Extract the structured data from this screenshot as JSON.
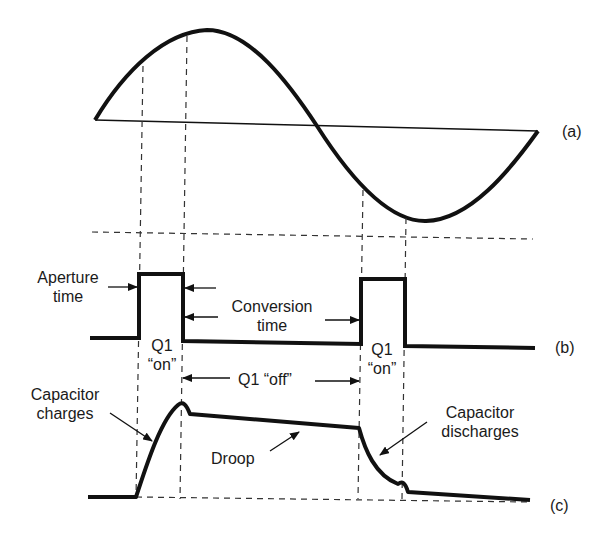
{
  "figure": {
    "type": "sample-and-hold timing diagram",
    "colors": {
      "stroke": "#111111",
      "dashed": "#333333",
      "background": "#ffffff"
    }
  },
  "panels": {
    "a": {
      "label": "(a)",
      "description": "Input sine wave"
    },
    "b": {
      "label": "(b)",
      "description": "Sampling pulse (Q1 gate)"
    },
    "c": {
      "label": "(c)",
      "description": "Capacitor voltage"
    }
  },
  "annotations": {
    "aperture_line1": "Aperture",
    "aperture_line2": "time",
    "conversion_line1": "Conversion",
    "conversion_line2": "time",
    "q1_on_1_line1": "Q1",
    "q1_on_1_line2": "“on”",
    "q1_on_2_line1": "Q1",
    "q1_on_2_line2": "“on”",
    "q1_off": "Q1 “off”",
    "cap_charges_line1": "Capacitor",
    "cap_charges_line2": "charges",
    "droop": "Droop",
    "cap_discharges_line1": "Capacitor",
    "cap_discharges_line2": "discharges"
  }
}
